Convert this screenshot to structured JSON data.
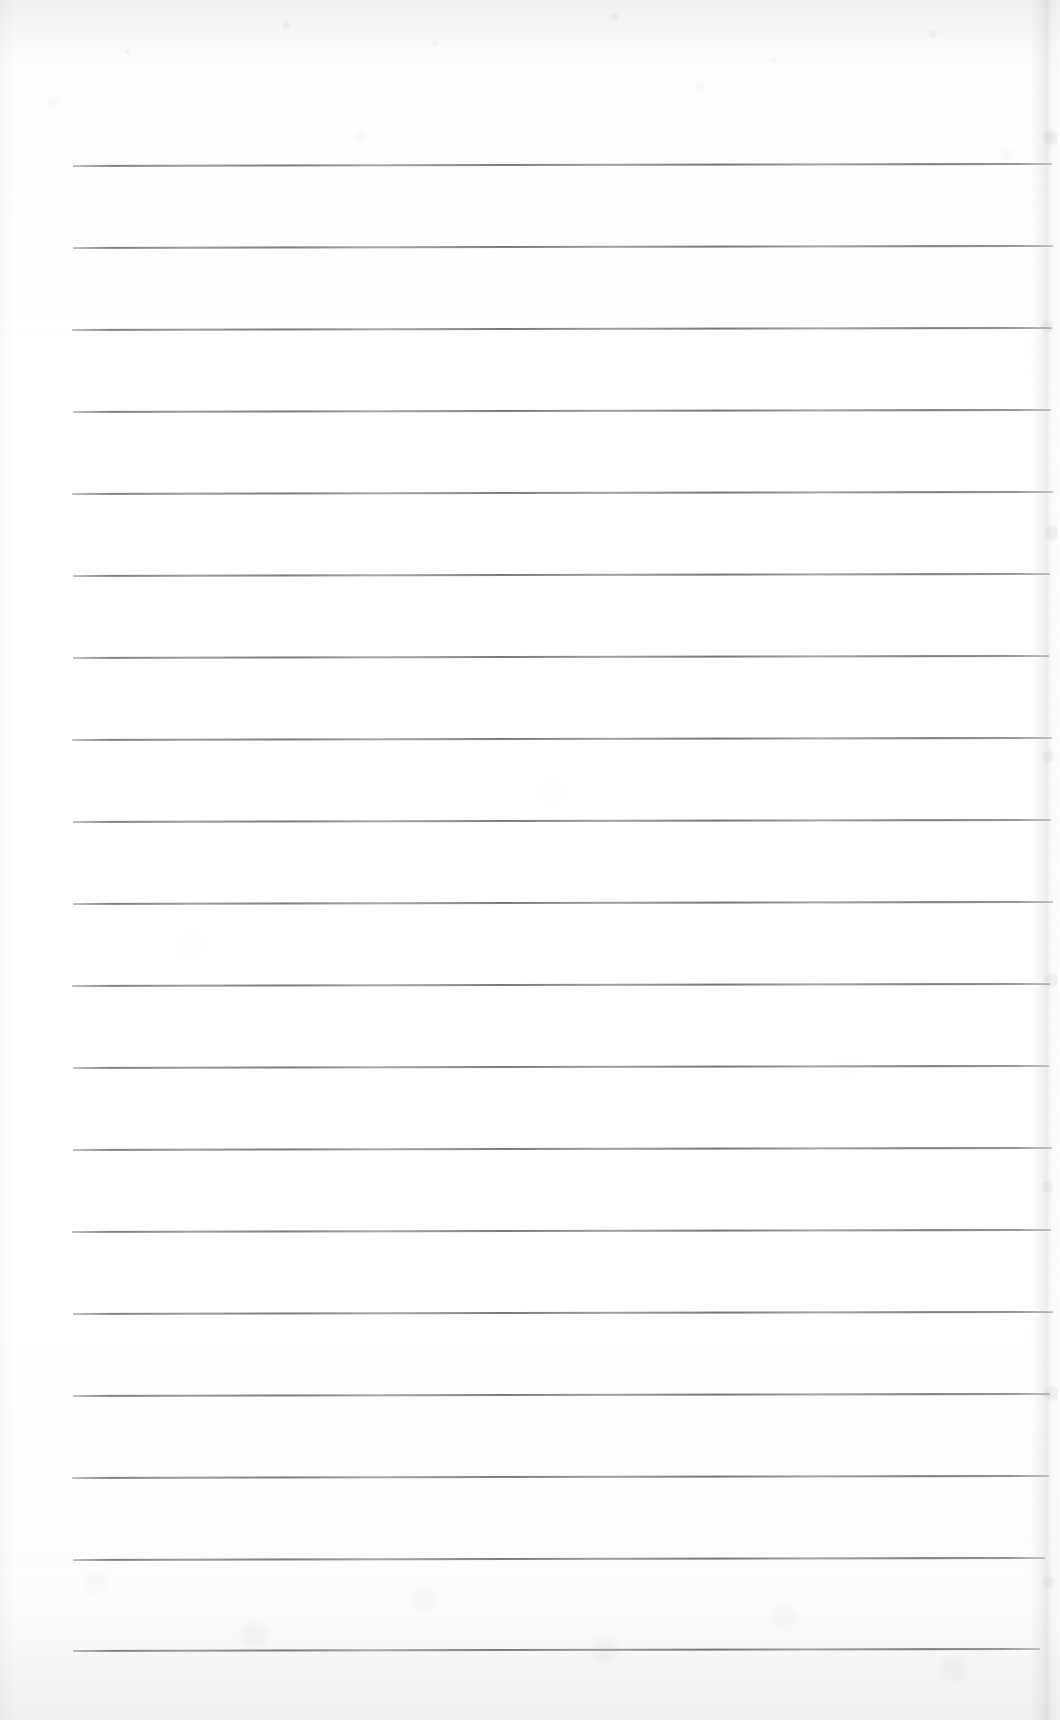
{
  "document": {
    "type": "scanned-lined-notebook-page",
    "title": "Blank ruled notebook page (scan)",
    "page_width": 1060,
    "page_height": 1720,
    "background_color": "#fdfdfd",
    "has_text": false,
    "has_handwriting": false,
    "visible_text": ""
  },
  "ruling": {
    "line_count": 19,
    "line_color": "#7d7d83",
    "line_thickness_px": 1.5,
    "first_line_y": 165,
    "line_spacing_y": 82.2,
    "line_left_x": 73,
    "line_right_x": 1052,
    "line_tilt_deg": -0.12,
    "lines": [
      {
        "index": 1,
        "y": 165,
        "x1": 73,
        "x2": 1052
      },
      {
        "index": 2,
        "y": 247,
        "x1": 73,
        "x2": 1053
      },
      {
        "index": 3,
        "y": 329,
        "x1": 72,
        "x2": 1052
      },
      {
        "index": 4,
        "y": 411,
        "x1": 73,
        "x2": 1051
      },
      {
        "index": 5,
        "y": 493,
        "x1": 72,
        "x2": 1053
      },
      {
        "index": 6,
        "y": 575,
        "x1": 73,
        "x2": 1050
      },
      {
        "index": 7,
        "y": 657,
        "x1": 73,
        "x2": 1049
      },
      {
        "index": 8,
        "y": 739,
        "x1": 72,
        "x2": 1052
      },
      {
        "index": 9,
        "y": 821,
        "x1": 73,
        "x2": 1051
      },
      {
        "index": 10,
        "y": 903,
        "x1": 73,
        "x2": 1053
      },
      {
        "index": 11,
        "y": 985,
        "x1": 72,
        "x2": 1050
      },
      {
        "index": 12,
        "y": 1067,
        "x1": 73,
        "x2": 1049
      },
      {
        "index": 13,
        "y": 1149,
        "x1": 73,
        "x2": 1052
      },
      {
        "index": 14,
        "y": 1231,
        "x1": 72,
        "x2": 1051
      },
      {
        "index": 15,
        "y": 1313,
        "x1": 73,
        "x2": 1053
      },
      {
        "index": 16,
        "y": 1395,
        "x1": 73,
        "x2": 1050
      },
      {
        "index": 17,
        "y": 1477,
        "x1": 72,
        "x2": 1049
      },
      {
        "index": 18,
        "y": 1559,
        "x1": 73,
        "x2": 1045
      },
      {
        "index": 19,
        "y": 1650,
        "x1": 73,
        "x2": 1040
      }
    ]
  },
  "margins": {
    "top_blank_px": 165,
    "bottom_blank_px": 70,
    "left_blank_px": 73,
    "right_blank_px": 8
  },
  "scan_artifacts": {
    "paper_grain": true,
    "top_edge_smudge": true,
    "bottom_edge_smudge": true,
    "right_page_edge_shadow": true,
    "shadow_color": "#8c8c92"
  }
}
